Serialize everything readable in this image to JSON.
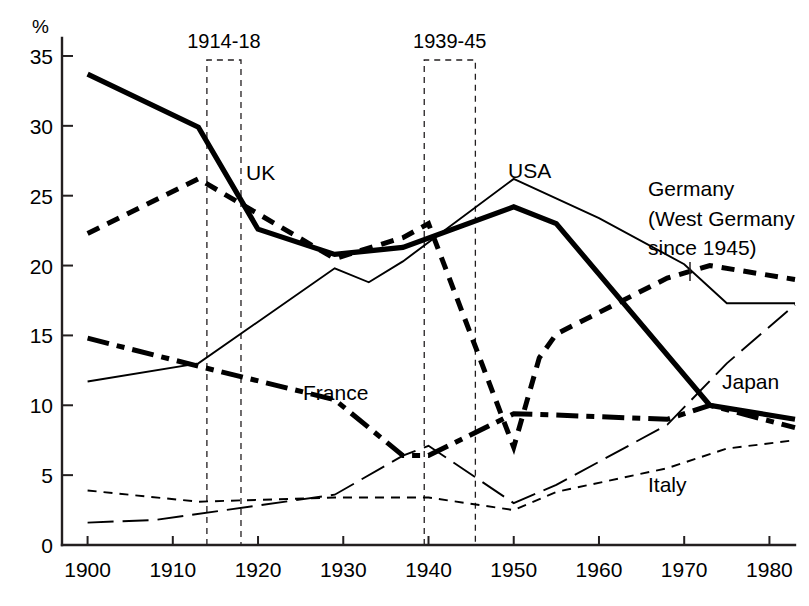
{
  "chart_data": {
    "type": "line",
    "title": "",
    "xlabel": "",
    "ylabel": "%",
    "y_unit_label": "%",
    "xlim": [
      1897,
      1983
    ],
    "ylim": [
      0,
      36
    ],
    "x_ticks": [
      1900,
      1910,
      1920,
      1930,
      1940,
      1950,
      1960,
      1970,
      1980
    ],
    "y_ticks": [
      0,
      5,
      10,
      15,
      20,
      25,
      30,
      35
    ],
    "grid": false,
    "legend_position": "inline-annotations",
    "annotations": [
      {
        "name": "war1",
        "label": "1914-18",
        "start": 1914,
        "end": 1918
      },
      {
        "name": "war2",
        "label": "1939-45",
        "start": 1939.5,
        "end": 1945.5
      }
    ],
    "series": [
      {
        "name": "UK",
        "label": "UK",
        "style": "thick-solid",
        "x": [
          1900,
          1913,
          1920,
          1929,
          1937,
          1950,
          1955,
          1973,
          1975,
          1983
        ],
        "values": [
          33.7,
          29.9,
          22.6,
          20.8,
          21.3,
          24.2,
          23.0,
          10.0,
          9.8,
          9.0
        ]
      },
      {
        "name": "Germany",
        "label": "Germany (West Germany since 1945)",
        "style": "thick-dashed",
        "x": [
          1900,
          1913,
          1929,
          1937,
          1940,
          1950,
          1953,
          1955,
          1968,
          1973,
          1983
        ],
        "values": [
          22.3,
          26.2,
          20.5,
          22.0,
          23.0,
          7.0,
          13.4,
          15.1,
          19.1,
          20.0,
          19.0
        ]
      },
      {
        "name": "France",
        "label": "France",
        "style": "thick-dash-dot",
        "x": [
          1900,
          1913,
          1929,
          1937,
          1940,
          1950,
          1955,
          1968,
          1973,
          1983
        ],
        "values": [
          14.8,
          12.8,
          10.4,
          6.4,
          6.4,
          9.4,
          9.3,
          9.0,
          10.0,
          8.4
        ]
      },
      {
        "name": "USA",
        "label": "USA",
        "style": "thin-solid",
        "x": [
          1900,
          1913,
          1929,
          1933,
          1937,
          1950,
          1960,
          1970,
          1975,
          1983
        ],
        "values": [
          11.7,
          13.0,
          19.8,
          18.8,
          20.3,
          26.2,
          23.4,
          20.1,
          17.3,
          17.3
        ]
      },
      {
        "name": "Japan",
        "label": "Japan",
        "style": "thin-long-dash",
        "x": [
          1900,
          1908,
          1929,
          1937,
          1940,
          1950,
          1955,
          1968,
          1975,
          1983
        ],
        "values": [
          1.6,
          1.8,
          3.6,
          6.4,
          7.1,
          3.0,
          4.3,
          8.6,
          13.0,
          17.2
        ]
      },
      {
        "name": "Italy",
        "label": "Italy",
        "style": "thin-short-dash",
        "x": [
          1900,
          1913,
          1929,
          1937,
          1940,
          1950,
          1955,
          1968,
          1975,
          1983
        ],
        "values": [
          3.9,
          3.1,
          3.4,
          3.4,
          3.4,
          2.5,
          3.8,
          5.5,
          6.9,
          7.5
        ]
      }
    ]
  },
  "labels": {
    "y_unit": "%",
    "uk": "UK",
    "usa": "USA",
    "france": "France",
    "japan": "Japan",
    "italy": "Italy",
    "germany_line1": "Germany",
    "germany_line2": "(West Germany",
    "germany_line3": "since 1945)",
    "war1": "1914-18",
    "war2": "1939-45"
  },
  "x_tick_labels": [
    "1900",
    "1910",
    "1920",
    "1930",
    "1940",
    "1950",
    "1960",
    "1970",
    "1980"
  ],
  "y_tick_labels": [
    "0",
    "5",
    "10",
    "15",
    "20",
    "25",
    "30",
    "35"
  ],
  "colors": {
    "ink": "#000000",
    "axis": "#231f20",
    "background": "#ffffff"
  }
}
